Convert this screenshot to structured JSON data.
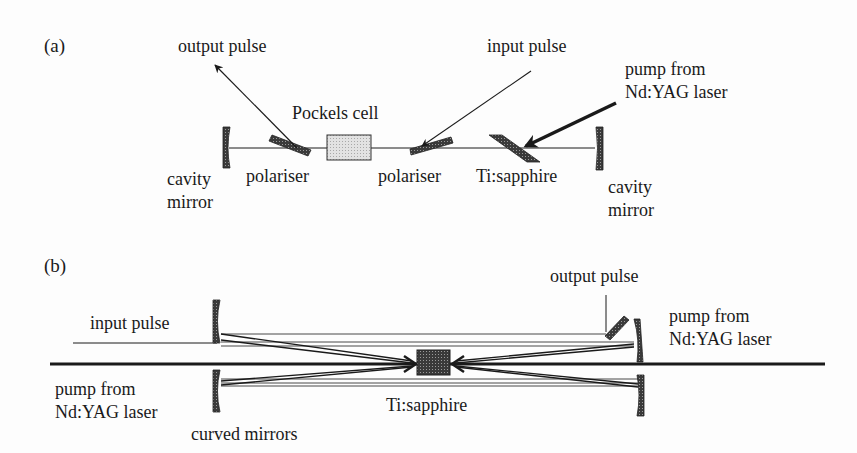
{
  "panel_a": {
    "label": "(a)",
    "output_pulse": "output pulse",
    "input_pulse": "input pulse",
    "pockels_cell": "Pockels cell",
    "pump_line1": "pump from",
    "pump_line2": "Nd:YAG laser",
    "left_mirror_line1": "cavity",
    "left_mirror_line2": "mirror",
    "polariser_left": "polariser",
    "polariser_right": "polariser",
    "crystal": "Ti:sapphire",
    "right_mirror_line1": "cavity",
    "right_mirror_line2": "mirror"
  },
  "panel_b": {
    "label": "(b)",
    "output_pulse": "output pulse",
    "input_pulse": "input pulse",
    "pump_right_line1": "pump from",
    "pump_right_line2": "Nd:YAG laser",
    "pump_left_line1": "pump from",
    "pump_left_line2": "Nd:YAG laser",
    "crystal": "Ti:sapphire",
    "mirrors": "curved mirrors"
  },
  "colors": {
    "ink": "#1a1a1a",
    "hatch": "#555555",
    "pockels_fill": "#d8d8d8",
    "background": "#fdfdfd"
  }
}
